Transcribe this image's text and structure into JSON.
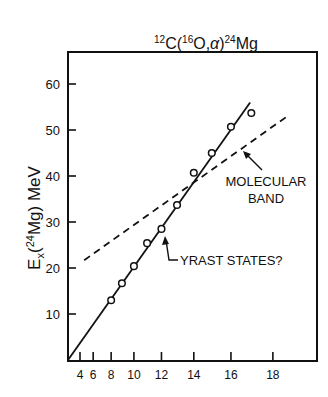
{
  "chart_data": {
    "type": "scatter",
    "title": "12C(16O,α)24Mg",
    "title_parts": {
      "a_mass": "12",
      "a": "C",
      "b_mass": "16",
      "b": "O",
      "ejectile": "α",
      "product_mass": "24",
      "product": "Mg"
    },
    "xlabel": "",
    "ylabel": "Ex(24Mg) MeV",
    "ylabel_parts": {
      "E": "E",
      "sub": "x",
      "mass": "24",
      "el": "Mg",
      "unit": "MeV"
    },
    "x_scale": "J(J+1)",
    "xticks": [
      4,
      6,
      8,
      10,
      12,
      14,
      16,
      18
    ],
    "yticks": [
      10,
      20,
      30,
      40,
      50,
      60
    ],
    "xlim_JJ1": [
      0,
      390
    ],
    "ylim": [
      0,
      66
    ],
    "grid": false,
    "series": [
      {
        "name": "Yrast states (data)",
        "style": "open-circle",
        "J": [
          8,
          9,
          10,
          11,
          12,
          13,
          14,
          15,
          16,
          17
        ],
        "values": [
          13.0,
          16.7,
          20.4,
          25.4,
          28.5,
          33.7,
          40.7,
          45.0,
          50.7,
          53.7
        ]
      },
      {
        "name": "Yrast line",
        "style": "solid",
        "JJ1": [
          0,
          304
        ],
        "values": [
          0,
          56
        ]
      },
      {
        "name": "Molecular band",
        "style": "dashed",
        "JJ1": [
          27,
          364
        ],
        "values": [
          21.7,
          52.8
        ]
      }
    ],
    "annotations": [
      {
        "text": "MOLECULAR",
        "line2": "BAND"
      },
      {
        "text": "YRAST STATES?"
      }
    ]
  }
}
